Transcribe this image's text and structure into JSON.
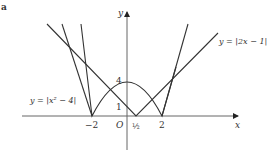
{
  "figure": {
    "corner_label": "a",
    "axes": {
      "x_label": "x",
      "y_label": "y",
      "origin_label": "O"
    },
    "x_ticks": [
      "−2",
      "½",
      "2"
    ],
    "y_ticks": [
      "1",
      "4"
    ],
    "curves": [
      {
        "name": "abs-quadratic",
        "label": "y = |x² − 4|"
      },
      {
        "name": "abs-linear",
        "label": "y = |2x − 1|"
      }
    ],
    "colors": {
      "curve": "#333333",
      "axis": "#555555"
    }
  }
}
